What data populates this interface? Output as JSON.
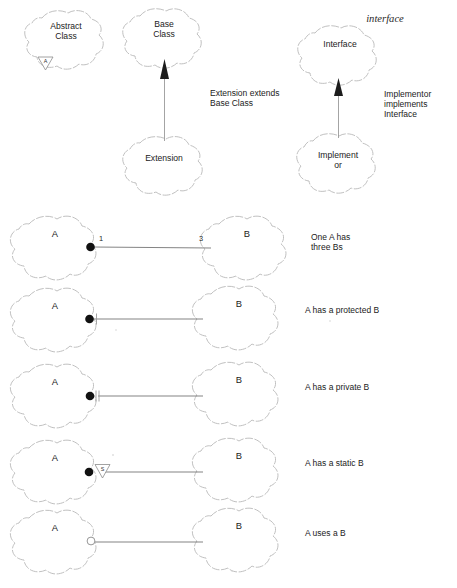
{
  "diagram": {
    "colors": {
      "background": "#ffffff",
      "blob_stroke": "#b9b9b9",
      "line": "#6e6e6e",
      "ink": "#1b1b1b",
      "marker_fill": "#111111"
    },
    "sections": {
      "abstract": {
        "node_label_line1": "Abstract",
        "node_label_line2": "Class",
        "marker_letter": "A",
        "marker_icon": "triangle-down-abstract-marker"
      },
      "inheritance": {
        "parent_label_line1": "Base",
        "parent_label_line2": "Class",
        "child_label": "Extension",
        "caption_line1": "Extension extends",
        "caption_line2": "Base Class",
        "arrow_icon": "solid-triangle-arrow-up"
      },
      "implementation": {
        "stereotype": "interface",
        "parent_label": "Interface",
        "child_label_line1": "Implement",
        "child_label_line2": "or",
        "caption_line1": "Implementor",
        "caption_line2": "implements",
        "caption_line3": "Interface",
        "arrow_icon": "solid-triangle-arrow-up"
      }
    },
    "associations": [
      {
        "id": "one-to-three",
        "source_label": "A",
        "target_label": "B",
        "source_multiplicity": "1",
        "target_multiplicity": "3",
        "marker_icon": "filled-circle",
        "caption_line1": "One A has",
        "caption_line2": "three Bs"
      },
      {
        "id": "protected-member",
        "source_label": "A",
        "target_label": "B",
        "source_multiplicity": "",
        "target_multiplicity": "",
        "marker_icon": "filled-circle-single-tick",
        "caption_line1": "A has a protected B",
        "caption_line2": ""
      },
      {
        "id": "private-member",
        "source_label": "A",
        "target_label": "B",
        "source_multiplicity": "",
        "target_multiplicity": "",
        "marker_icon": "filled-circle-double-tick",
        "caption_line1": "A has a private B",
        "caption_line2": ""
      },
      {
        "id": "static-member",
        "source_label": "A",
        "target_label": "B",
        "source_multiplicity": "",
        "target_multiplicity": "",
        "marker_icon": "filled-circle-triangle-s",
        "marker_letter": "S",
        "caption_line1": "A has a static B",
        "caption_line2": ""
      },
      {
        "id": "uses-dependency",
        "source_label": "A",
        "target_label": "B",
        "source_multiplicity": "",
        "target_multiplicity": "",
        "marker_icon": "hollow-circle",
        "caption_line1": "A uses a  B",
        "caption_line2": ""
      }
    ]
  }
}
